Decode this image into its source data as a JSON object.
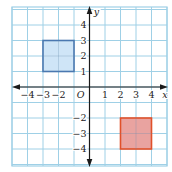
{
  "figure": {
    "type": "coordinate-plane",
    "x_axis_label": "x",
    "y_axis_label": "y",
    "origin_label": "O",
    "x_range": [
      -5,
      5
    ],
    "y_range": [
      -5,
      5
    ],
    "x_tick_labels": [
      {
        "value": -4,
        "label": "−4"
      },
      {
        "value": -3,
        "label": "−3"
      },
      {
        "value": -2,
        "label": "−2"
      },
      {
        "value": 1,
        "label": "1"
      },
      {
        "value": 2,
        "label": "2"
      },
      {
        "value": 3,
        "label": "3"
      },
      {
        "value": 4,
        "label": "4"
      }
    ],
    "y_tick_labels": [
      {
        "value": 4,
        "label": "4"
      },
      {
        "value": 3,
        "label": "3"
      },
      {
        "value": 2,
        "label": "2"
      },
      {
        "value": 1,
        "label": "1"
      },
      {
        "value": -2,
        "label": "−2"
      },
      {
        "value": -3,
        "label": "−3"
      },
      {
        "value": -4,
        "label": "−4"
      }
    ],
    "shapes": [
      {
        "name": "blue-square",
        "x_min": -3,
        "x_max": -1,
        "y_min": 1,
        "y_max": 3,
        "fill": "#cfe5f7",
        "stroke": "#4a78b0"
      },
      {
        "name": "red-square",
        "x_min": 2,
        "x_max": 4,
        "y_min": -4,
        "y_max": -2,
        "fill": "#e9a3a0",
        "stroke": "#e0502a"
      }
    ],
    "colors": {
      "grid": "#9fd0e6",
      "border": "#9fd0e6",
      "axis": "#1a1a1a",
      "text": "#222222"
    }
  }
}
